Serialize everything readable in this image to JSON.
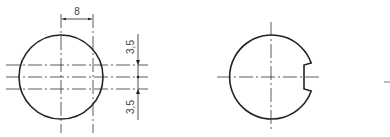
{
  "figure": {
    "left_view": {
      "dimensions": {
        "horizontal": "8",
        "vertical_top": "3,5",
        "vertical_bottom": "3,5"
      }
    },
    "right_view": {
      "feature": "circle-with-rectangular-notch"
    }
  },
  "colors": {
    "stroke": "#222222",
    "background": "#ffffff"
  }
}
